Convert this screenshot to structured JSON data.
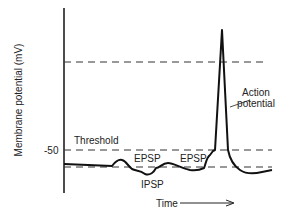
{
  "diagram": {
    "type": "action-potential-trace",
    "ylabel": "Membrane potential (mV)",
    "xlabel": "Time",
    "y_tick": "-50",
    "labels": {
      "threshold": "Threshold",
      "epsp1": "EPSP",
      "epsp2": "EPSP",
      "ipsp": "IPSP",
      "action_line1": "Action",
      "action_line2": "potential"
    },
    "reference_lines": [
      "overshoot level",
      "threshold (-50 mV)",
      "resting potential"
    ]
  }
}
